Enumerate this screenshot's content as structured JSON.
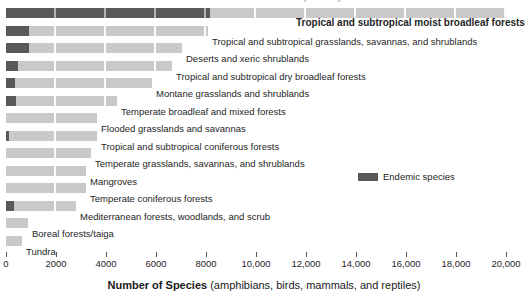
{
  "clipped_header": {
    "text": "Number of species by biome"
  },
  "legend": {
    "label": "Endemic species",
    "swatch_color": "#595959"
  },
  "axis_title": {
    "bold_part": "Number of Species",
    "normal_part": " (amphibians, birds, mammals, and reptiles)"
  },
  "colors": {
    "total_bar": "#c9c9c9",
    "endemic_bar": "#595959",
    "text": "#262626"
  },
  "chart_data": {
    "type": "bar",
    "orientation": "horizontal",
    "title": "",
    "xlabel": "Number of Species (amphibians, birds, mammals, and reptiles)",
    "ylabel": "",
    "xlim": [
      0,
      20000
    ],
    "xticks": [
      0,
      2000,
      4000,
      6000,
      8000,
      10000,
      12000,
      14000,
      16000,
      18000,
      20000
    ],
    "xtick_labels": [
      "0",
      "2000",
      "4000",
      "6000",
      "8000",
      "10,000",
      "12,000",
      "14,000",
      "16,000",
      "18,000",
      "20,000"
    ],
    "grid": false,
    "legend_position": "middle-right",
    "categories": [
      "Tropical and subtropical moist broadleaf forests",
      "Tropical and subtropical grasslands, savannas, and shrublands",
      "Deserts and xeric shrublands",
      "Tropical and subtropical dry broadleaf forests",
      "Montane grasslands and shrublands",
      "Temperate broadleaf and mixed forests",
      "Flooded grasslands and savannas",
      "Tropical and subtropical coniferous forests",
      "Temperate grasslands, savannas, and shrublands",
      "Mangroves",
      "Temperate coniferous forests",
      "Mediterranean forests, woodlands, and scrub",
      "Boreal forests/taiga",
      "Tundra"
    ],
    "series": [
      {
        "name": "Total species",
        "color": "#c9c9c9",
        "values": [
          20000,
          8080,
          7040,
          6640,
          5840,
          4440,
          3640,
          3640,
          3400,
          3200,
          3200,
          2800,
          880,
          640
        ]
      },
      {
        "name": "Endemic species",
        "color": "#595959",
        "values": [
          8160,
          920,
          920,
          480,
          360,
          400,
          0,
          120,
          0,
          0,
          0,
          320,
          0,
          0
        ]
      }
    ],
    "bold_category": "Tropical and subtropical moist broadleaf forests"
  }
}
